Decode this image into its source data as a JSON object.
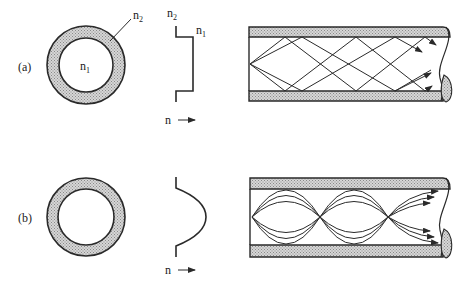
{
  "figure": {
    "panels": [
      {
        "id": "a",
        "label": "(a)",
        "cross_section": {
          "core_label": "n",
          "core_sub": "1",
          "cladding_label": "n",
          "cladding_sub": "2"
        },
        "profile": {
          "type": "step",
          "label_top_left": "n",
          "label_top_left_sub": "2",
          "label_top_right": "n",
          "label_top_right_sub": "1",
          "axis_label": "n"
        },
        "fiber": {
          "type": "step-index",
          "ray_style": "zigzag"
        }
      },
      {
        "id": "b",
        "label": "(b)",
        "cross_section": {},
        "profile": {
          "type": "graded",
          "axis_label": "n"
        },
        "fiber": {
          "type": "graded-index",
          "ray_style": "sinusoidal"
        }
      }
    ],
    "colors": {
      "line": "#2a2a2a",
      "cladding_fill": "#bdbdbd",
      "background": "#ffffff"
    }
  }
}
